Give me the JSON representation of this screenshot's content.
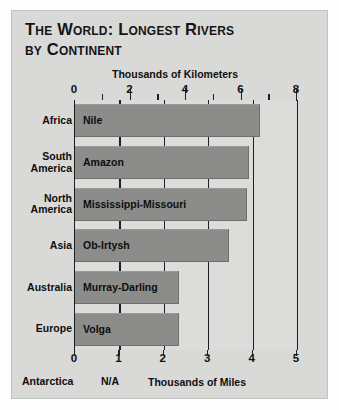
{
  "title": {
    "line1": "The World:  Longest Rivers",
    "line2": "by Continent"
  },
  "chart_data": {
    "type": "bar",
    "orientation": "horizontal",
    "title": "The World: Longest Rivers by Continent",
    "categories": [
      "Africa",
      "South America",
      "North America",
      "Asia",
      "Australia",
      "Europe"
    ],
    "bar_labels": [
      "Nile",
      "Amazon",
      "Mississippi-Missouri",
      "Ob-Irtysh",
      "Murray-Darling",
      "Volga"
    ],
    "values": [
      6.65,
      6.27,
      6.2,
      5.55,
      3.75,
      3.75
    ],
    "value_unit": "thousands of kilometers",
    "series": [
      {
        "name": "Length (thousands of kilometers)",
        "values": [
          6.65,
          6.27,
          6.2,
          5.55,
          3.75,
          3.75
        ]
      },
      {
        "name": "Length (thousands of miles)",
        "values": [
          4.13,
          3.89,
          3.85,
          3.45,
          2.33,
          2.33
        ]
      }
    ],
    "top_axis": {
      "label": "Thousands of Kilometers",
      "range": [
        0,
        8
      ],
      "major_ticks": [
        0,
        2,
        4,
        6,
        8
      ],
      "minor_ticks": [
        1,
        3,
        5,
        7
      ],
      "tick_labels": [
        "0",
        "2",
        "4",
        "6",
        "8"
      ]
    },
    "bottom_axis": {
      "label": "Thousands of Miles",
      "range": [
        0,
        5
      ],
      "major_ticks": [
        0,
        1,
        2,
        3,
        4,
        5
      ],
      "tick_labels": [
        "0",
        "1",
        "2",
        "3",
        "4",
        "5"
      ]
    },
    "gridlines": {
      "on": true,
      "axis": "miles",
      "at": [
        1,
        2,
        3,
        4,
        5
      ]
    },
    "legend": {
      "present": false
    },
    "footnote": {
      "category": "Antarctica",
      "value": "N/A"
    },
    "colors": {
      "bar": "#8c8c8a",
      "plot_background": "#dcdcda",
      "panel_background": "#d9d9d7",
      "axis": "#1d1d1d",
      "text": "#0e0e0e"
    }
  },
  "top_axis_caption": "Thousands of Kilometers",
  "bottom_axis_caption": "Thousands of Miles",
  "km_tick_labels": [
    "0",
    "2",
    "4",
    "6",
    "8"
  ],
  "mile_tick_labels": [
    "0",
    "1",
    "2",
    "3",
    "4",
    "5"
  ],
  "rows": [
    {
      "continent": "Africa",
      "continent_line1": "Africa",
      "continent_line2": "",
      "river": "Nile"
    },
    {
      "continent": "South America",
      "continent_line1": "South",
      "continent_line2": "America",
      "river": "Amazon"
    },
    {
      "continent": "North America",
      "continent_line1": "North",
      "continent_line2": "America",
      "river": "Mississippi-Missouri"
    },
    {
      "continent": "Asia",
      "continent_line1": "Asia",
      "continent_line2": "",
      "river": "Ob-Irtysh"
    },
    {
      "continent": "Australia",
      "continent_line1": "Australia",
      "continent_line2": "",
      "river": "Murray-Darling"
    },
    {
      "continent": "Europe",
      "continent_line1": "Europe",
      "continent_line2": "",
      "river": "Volga"
    }
  ],
  "footer": {
    "continent": "Antarctica",
    "value": "N/A"
  }
}
